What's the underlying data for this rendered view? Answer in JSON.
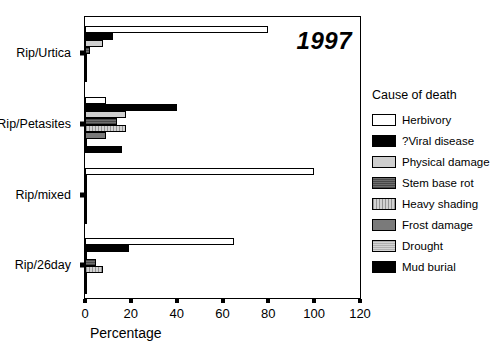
{
  "chart_data": {
    "type": "bar",
    "orientation": "horizontal",
    "title": "1997",
    "xlabel": "Percentage",
    "ylabel": "",
    "xlim": [
      0,
      120
    ],
    "xticks": [
      0,
      20,
      40,
      60,
      80,
      100,
      120
    ],
    "grid": false,
    "legend_title": "Cause of death",
    "legend_position": "right",
    "categories": [
      "Rip/Urtica",
      "Rip/Petasites",
      "Rip/mixed",
      "Rip/26day"
    ],
    "series": [
      {
        "name": "Herbivory",
        "color": "#ffffff",
        "values": [
          80,
          9,
          100,
          65
        ]
      },
      {
        "name": "?Viral disease",
        "color": "#000000",
        "values": [
          12,
          40,
          0,
          19
        ]
      },
      {
        "name": "Physical damage",
        "color": "#cfcfcf",
        "values": [
          8,
          18,
          0,
          1
        ]
      },
      {
        "name": "Stem base rot",
        "color": "#6e6e6e",
        "values": [
          2,
          14,
          0,
          5
        ]
      },
      {
        "name": "Heavy shading",
        "color": "#d2d2d2",
        "values": [
          1,
          18,
          0,
          8
        ]
      },
      {
        "name": "Frost damage",
        "color": "#7a7a7a",
        "values": [
          0,
          9,
          0,
          0
        ]
      },
      {
        "name": "Drought",
        "color": "#b0b0b0",
        "values": [
          0,
          0,
          0,
          0
        ]
      },
      {
        "name": "Mud burial",
        "color": "#000000",
        "values": [
          0,
          16,
          0,
          0
        ]
      }
    ]
  },
  "axes": {
    "x_title": "Percentage",
    "x_tick_labels": [
      "0",
      "20",
      "40",
      "60",
      "80",
      "100",
      "120"
    ],
    "y_tick_labels": [
      "Rip/Urtica",
      "Rip/Petasites",
      "Rip/mixed",
      "Rip/26day"
    ]
  },
  "annotations": {
    "year": "1997"
  },
  "legend": {
    "title": "Cause of death",
    "items": [
      {
        "label": "Herbivory"
      },
      {
        "label": "?Viral disease"
      },
      {
        "label": "Physical damage"
      },
      {
        "label": "Stem base rot"
      },
      {
        "label": "Heavy shading"
      },
      {
        "label": "Frost damage"
      },
      {
        "label": "Drought"
      },
      {
        "label": "Mud burial"
      }
    ]
  }
}
